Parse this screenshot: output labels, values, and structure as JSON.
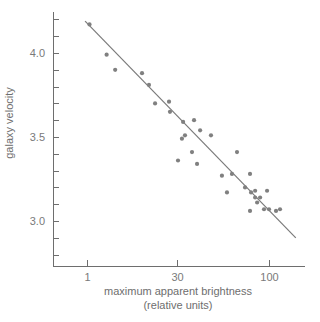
{
  "chart_data": {
    "type": "scatter",
    "title": "",
    "xlabel": "maximum apparent brightness",
    "xlabel_line2": "(relative units)",
    "ylabel": "galaxy velocity",
    "x_scale": "log",
    "x_ticks": [
      {
        "label": "1",
        "value": 1
      },
      {
        "label": "30",
        "value": 30
      },
      {
        "label": "100",
        "value": 100
      }
    ],
    "y_ticks_labeled": [
      {
        "label": "4.0",
        "value": 4.0
      },
      {
        "label": "3.5",
        "value": 3.5
      },
      {
        "label": "3.0",
        "value": 3.0
      }
    ],
    "y_minor_tick_step": 0.1,
    "ylim": [
      2.72,
      4.22
    ],
    "grid": false,
    "legend": null,
    "points": [
      {
        "x": 1.1,
        "y": 4.17
      },
      {
        "x": 2.1,
        "y": 3.99
      },
      {
        "x": 2.9,
        "y": 3.9
      },
      {
        "x": 8.0,
        "y": 3.88
      },
      {
        "x": 10.4,
        "y": 3.81
      },
      {
        "x": 13.1,
        "y": 3.7
      },
      {
        "x": 22.2,
        "y": 3.71
      },
      {
        "x": 23.0,
        "y": 3.65
      },
      {
        "x": 32.5,
        "y": 3.59
      },
      {
        "x": 37.5,
        "y": 3.6
      },
      {
        "x": 33.3,
        "y": 3.51
      },
      {
        "x": 32.0,
        "y": 3.49
      },
      {
        "x": 40.6,
        "y": 3.54
      },
      {
        "x": 46.8,
        "y": 3.51
      },
      {
        "x": 36.5,
        "y": 3.41
      },
      {
        "x": 30.4,
        "y": 3.36
      },
      {
        "x": 39.0,
        "y": 3.34
      },
      {
        "x": 65.8,
        "y": 3.41
      },
      {
        "x": 54.0,
        "y": 3.27
      },
      {
        "x": 61.6,
        "y": 3.28
      },
      {
        "x": 78.0,
        "y": 3.28
      },
      {
        "x": 57.7,
        "y": 3.17
      },
      {
        "x": 73.1,
        "y": 3.2
      },
      {
        "x": 79.1,
        "y": 3.17
      },
      {
        "x": 83.4,
        "y": 3.18
      },
      {
        "x": 97.5,
        "y": 3.18
      },
      {
        "x": 83.4,
        "y": 3.14
      },
      {
        "x": 89.0,
        "y": 3.14
      },
      {
        "x": 85.6,
        "y": 3.11
      },
      {
        "x": 78.0,
        "y": 3.06
      },
      {
        "x": 93.7,
        "y": 3.07
      },
      {
        "x": 100.0,
        "y": 3.07
      },
      {
        "x": 109.6,
        "y": 3.06
      },
      {
        "x": 115.5,
        "y": 3.07
      }
    ],
    "fit_line": {
      "start": {
        "x": 0.93,
        "y": 4.19
      },
      "end": {
        "x": 142,
        "y": 2.9
      }
    },
    "colors": {
      "axis": "#6e6e6e",
      "points": "#808080",
      "line": "#7a7a7a",
      "text": "#7a7a7a"
    }
  }
}
